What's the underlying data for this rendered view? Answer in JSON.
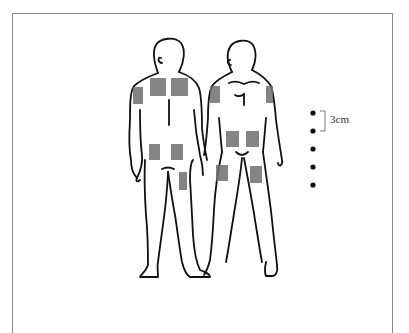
{
  "diagram": {
    "type": "body-application-sites",
    "views": [
      "back",
      "front"
    ],
    "patch_color": "#6e6e6e",
    "outline_color": "#111111",
    "patches": [
      {
        "view": "back",
        "site": "upper-back-left",
        "x": 150,
        "y": 78,
        "w": 16,
        "h": 18
      },
      {
        "view": "back",
        "site": "upper-back-right",
        "x": 171,
        "y": 78,
        "w": 17,
        "h": 18
      },
      {
        "view": "back",
        "site": "upper-arm",
        "x": 133,
        "y": 87,
        "w": 10,
        "h": 17
      },
      {
        "view": "back",
        "site": "lower-back-left",
        "x": 149,
        "y": 144,
        "w": 11,
        "h": 16
      },
      {
        "view": "back",
        "site": "lower-back-right",
        "x": 171,
        "y": 144,
        "w": 12,
        "h": 16
      },
      {
        "view": "back",
        "site": "thigh",
        "x": 179,
        "y": 172,
        "w": 8,
        "h": 18
      },
      {
        "view": "front",
        "site": "upper-arm-right",
        "x": 210,
        "y": 86,
        "w": 10,
        "h": 17
      },
      {
        "view": "front",
        "site": "upper-arm-left",
        "x": 266,
        "y": 86,
        "w": 7,
        "h": 17
      },
      {
        "view": "front",
        "site": "abdomen-left",
        "x": 226,
        "y": 131,
        "w": 13,
        "h": 16
      },
      {
        "view": "front",
        "site": "abdomen-right",
        "x": 246,
        "y": 131,
        "w": 13,
        "h": 16
      },
      {
        "view": "front",
        "site": "thigh-right",
        "x": 216,
        "y": 165,
        "w": 12,
        "h": 16
      },
      {
        "view": "front",
        "site": "thigh-left",
        "x": 250,
        "y": 166,
        "w": 12,
        "h": 17
      }
    ],
    "scale": {
      "label": "3cm",
      "dots": [
        113,
        131,
        149,
        167,
        185
      ],
      "dot_x": 313
    }
  }
}
